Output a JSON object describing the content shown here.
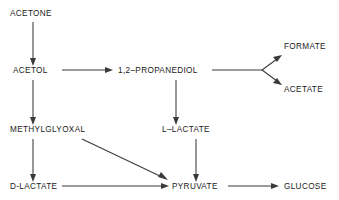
{
  "diagram": {
    "type": "metabolic-pathway-flow-diagram",
    "background_color": "#ffffff",
    "line_color": "#3a3a3a",
    "text_color": "#1a1a1a",
    "nodes": [
      {
        "id": "acetone",
        "label": "ACETONE",
        "x": 10,
        "y": 16
      },
      {
        "id": "acetol",
        "label": "ACETOL",
        "x": 13,
        "y": 73
      },
      {
        "id": "propanediol",
        "label": "1,2–PROPANEDIOL",
        "x": 118,
        "y": 73
      },
      {
        "id": "formate",
        "label": "FORMATE",
        "x": 284,
        "y": 49
      },
      {
        "id": "acetate",
        "label": "ACETATE",
        "x": 284,
        "y": 92
      },
      {
        "id": "methylglyoxal",
        "label": "METHYLGLYOXAL",
        "x": 10,
        "y": 132
      },
      {
        "id": "l-lactate",
        "label": "L–LACTATE",
        "x": 162,
        "y": 132
      },
      {
        "id": "d-lactate",
        "label": "D-LACTATE",
        "x": 10,
        "y": 189
      },
      {
        "id": "pyruvate",
        "label": "PYRUVATE",
        "x": 172,
        "y": 189
      },
      {
        "id": "glucose",
        "label": "GLUCOSE",
        "x": 284,
        "y": 189
      }
    ],
    "edges": [
      {
        "id": "acetone-to-acetol",
        "from": "ACETONE",
        "to": "ACETOL",
        "orientation": "vertical"
      },
      {
        "id": "acetol-to-propanediol",
        "from": "ACETOL",
        "to": "1,2–PROPANEDIOL",
        "orientation": "horizontal"
      },
      {
        "id": "acetol-to-methylglyoxal",
        "from": "ACETOL",
        "to": "METHYLGLYOXAL",
        "orientation": "vertical"
      },
      {
        "id": "propanediol-to-formate",
        "from": "1,2–PROPANEDIOL",
        "to": "FORMATE",
        "orientation": "branch-up"
      },
      {
        "id": "propanediol-to-acetate",
        "from": "1,2–PROPANEDIOL",
        "to": "ACETATE",
        "orientation": "branch-down"
      },
      {
        "id": "propanediol-to-l-lactate",
        "from": "1,2–PROPANEDIOL",
        "to": "L–LACTATE",
        "orientation": "vertical"
      },
      {
        "id": "methylglyoxal-to-d-lactate",
        "from": "METHYLGLYOXAL",
        "to": "D-LACTATE",
        "orientation": "vertical"
      },
      {
        "id": "methylglyoxal-to-pyruvate",
        "from": "METHYLGLYOXAL",
        "to": "PYRUVATE",
        "orientation": "diagonal"
      },
      {
        "id": "l-lactate-to-pyruvate",
        "from": "L–LACTATE",
        "to": "PYRUVATE",
        "orientation": "vertical"
      },
      {
        "id": "d-lactate-to-pyruvate",
        "from": "D-LACTATE",
        "to": "PYRUVATE",
        "orientation": "horizontal"
      },
      {
        "id": "pyruvate-to-glucose",
        "from": "PYRUVATE",
        "to": "GLUCOSE",
        "orientation": "horizontal"
      }
    ]
  }
}
